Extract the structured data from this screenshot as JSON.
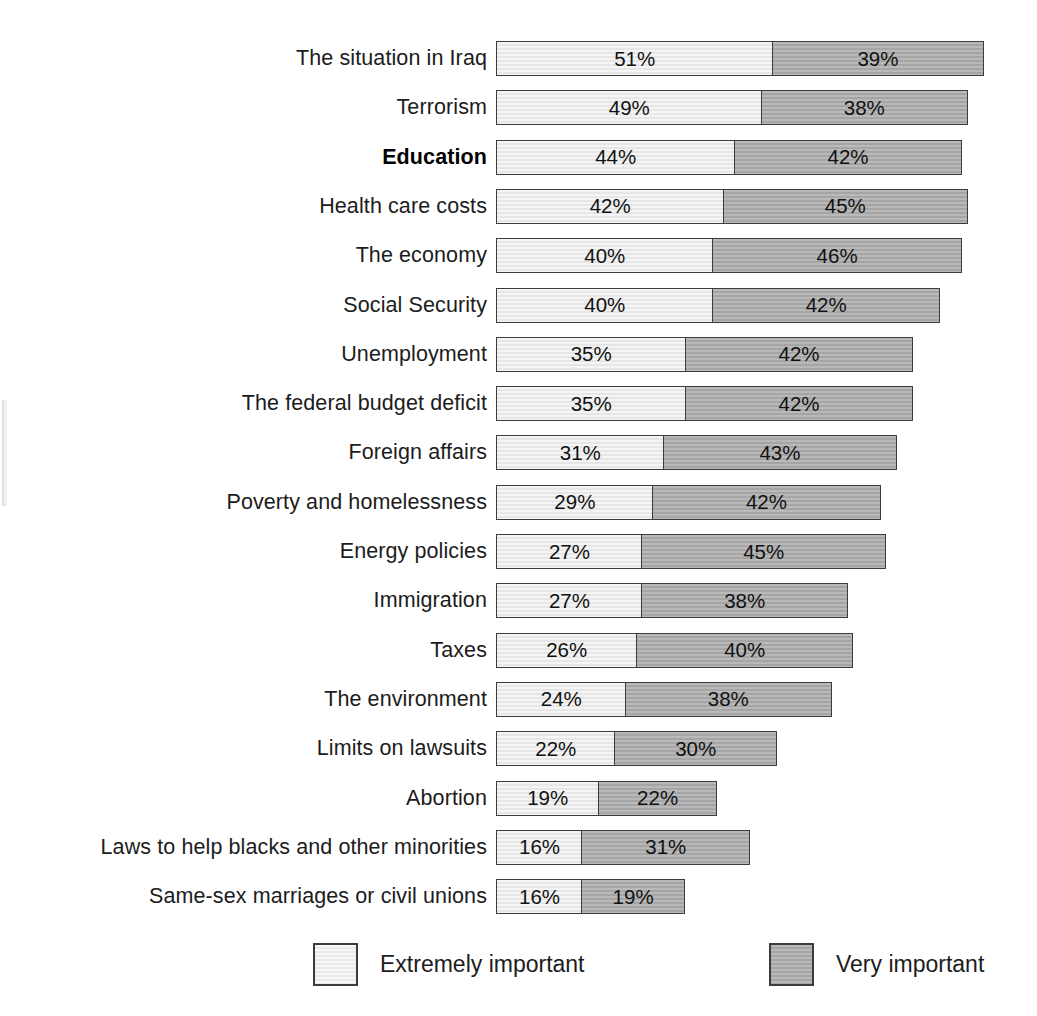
{
  "colors": {
    "extremely_important": "#e9e9e9",
    "very_important": "#aaaaaa",
    "border": "#3c3c3c",
    "text": "#1c1c1c",
    "background": "#ffffff"
  },
  "legend": {
    "position": "bottom",
    "items": [
      {
        "key": "extremely",
        "label": "Extremely important",
        "color": "#e9e9e9"
      },
      {
        "key": "very",
        "label": "Very important",
        "color": "#aaaaaa"
      }
    ]
  },
  "highlighted_category": "Education",
  "chart_data": {
    "type": "bar",
    "orientation": "horizontal",
    "stacked": true,
    "title": "",
    "subtitle": "",
    "xlabel": "",
    "ylabel": "",
    "xlim": [
      0,
      100
    ],
    "grid": false,
    "units": "%",
    "legend_position": "bottom",
    "categories": [
      "The situation in Iraq",
      "Terrorism",
      "Education",
      "Health care costs",
      "The economy",
      "Social Security",
      "Unemployment",
      "The federal budget deficit",
      "Foreign affairs",
      "Poverty and homelessness",
      "Energy policies",
      "Immigration",
      "Taxes",
      "The environment",
      "Limits on lawsuits",
      "Abortion",
      "Laws to help blacks and other minorities",
      "Same-sex marriages or civil unions"
    ],
    "series": [
      {
        "name": "Extremely important",
        "values": [
          51,
          49,
          44,
          42,
          40,
          40,
          35,
          35,
          31,
          29,
          27,
          27,
          26,
          24,
          22,
          19,
          16,
          16
        ]
      },
      {
        "name": "Very important",
        "values": [
          39,
          38,
          42,
          45,
          46,
          42,
          42,
          42,
          43,
          42,
          45,
          38,
          40,
          38,
          30,
          22,
          31,
          19
        ]
      }
    ],
    "rows": [
      {
        "label": "The situation in Iraq",
        "extremely": 51,
        "extremely_text": "51%",
        "very": 39,
        "very_text": "39%",
        "total": 90,
        "bold": false
      },
      {
        "label": "Terrorism",
        "extremely": 49,
        "extremely_text": "49%",
        "very": 38,
        "very_text": "38%",
        "total": 87,
        "bold": false
      },
      {
        "label": "Education",
        "extremely": 44,
        "extremely_text": "44%",
        "very": 42,
        "very_text": "42%",
        "total": 86,
        "bold": true
      },
      {
        "label": "Health care costs",
        "extremely": 42,
        "extremely_text": "42%",
        "very": 45,
        "very_text": "45%",
        "total": 87,
        "bold": false
      },
      {
        "label": "The economy",
        "extremely": 40,
        "extremely_text": "40%",
        "very": 46,
        "very_text": "46%",
        "total": 86,
        "bold": false
      },
      {
        "label": "Social Security",
        "extremely": 40,
        "extremely_text": "40%",
        "very": 42,
        "very_text": "42%",
        "total": 82,
        "bold": false
      },
      {
        "label": "Unemployment",
        "extremely": 35,
        "extremely_text": "35%",
        "very": 42,
        "very_text": "42%",
        "total": 77,
        "bold": false
      },
      {
        "label": "The federal budget deficit",
        "extremely": 35,
        "extremely_text": "35%",
        "very": 42,
        "very_text": "42%",
        "total": 77,
        "bold": false
      },
      {
        "label": "Foreign affairs",
        "extremely": 31,
        "extremely_text": "31%",
        "very": 43,
        "very_text": "43%",
        "total": 74,
        "bold": false
      },
      {
        "label": "Poverty and homelessness",
        "extremely": 29,
        "extremely_text": "29%",
        "very": 42,
        "very_text": "42%",
        "total": 71,
        "bold": false
      },
      {
        "label": "Energy policies",
        "extremely": 27,
        "extremely_text": "27%",
        "very": 45,
        "very_text": "45%",
        "total": 72,
        "bold": false
      },
      {
        "label": "Immigration",
        "extremely": 27,
        "extremely_text": "27%",
        "very": 38,
        "very_text": "38%",
        "total": 65,
        "bold": false
      },
      {
        "label": "Taxes",
        "extremely": 26,
        "extremely_text": "26%",
        "very": 40,
        "very_text": "40%",
        "total": 66,
        "bold": false
      },
      {
        "label": "The environment",
        "extremely": 24,
        "extremely_text": "24%",
        "very": 38,
        "very_text": "38%",
        "total": 62,
        "bold": false
      },
      {
        "label": "Limits on lawsuits",
        "extremely": 22,
        "extremely_text": "22%",
        "very": 30,
        "very_text": "30%",
        "total": 52,
        "bold": false
      },
      {
        "label": "Abortion",
        "extremely": 19,
        "extremely_text": "19%",
        "very": 22,
        "very_text": "22%",
        "total": 41,
        "bold": false
      },
      {
        "label": "Laws to help blacks and other minorities",
        "extremely": 16,
        "extremely_text": "16%",
        "very": 31,
        "very_text": "31%",
        "total": 47,
        "bold": false
      },
      {
        "label": "Same-sex marriages or civil unions",
        "extremely": 16,
        "extremely_text": "16%",
        "very": 19,
        "very_text": "19%",
        "total": 35,
        "bold": false
      }
    ]
  }
}
